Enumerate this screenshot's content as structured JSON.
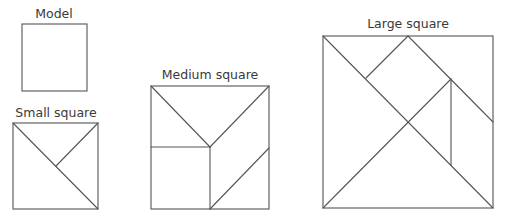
{
  "diagram": {
    "line_color": "#555555",
    "text_color": "#3a3a3a",
    "figures": [
      {
        "label": "Model",
        "square": {
          "x": 22,
          "y": 24,
          "w": 65,
          "h": 67
        },
        "segments": []
      },
      {
        "label": "Small square",
        "square": {
          "x": 13,
          "y": 123,
          "w": 85,
          "h": 86
        },
        "segments": [
          [
            13,
            123,
            98,
            209
          ],
          [
            98,
            123,
            56,
            166
          ]
        ]
      },
      {
        "label": "Medium square",
        "square": {
          "x": 151,
          "y": 86,
          "w": 118,
          "h": 123
        },
        "segments": [
          [
            151,
            86,
            210,
            147
          ],
          [
            269,
            86,
            210,
            147
          ],
          [
            151,
            147,
            210,
            147
          ],
          [
            210,
            147,
            210,
            209
          ],
          [
            269,
            148,
            210,
            209
          ]
        ]
      },
      {
        "label": "Large square",
        "square": {
          "x": 323,
          "y": 36,
          "w": 170,
          "h": 172
        },
        "segments": [
          [
            323,
            36,
            493,
            208
          ],
          [
            323,
            208,
            451,
            79
          ],
          [
            408,
            36,
            366,
            78
          ],
          [
            408,
            36,
            493,
            122
          ],
          [
            451,
            79,
            451,
            165
          ]
        ]
      }
    ]
  }
}
